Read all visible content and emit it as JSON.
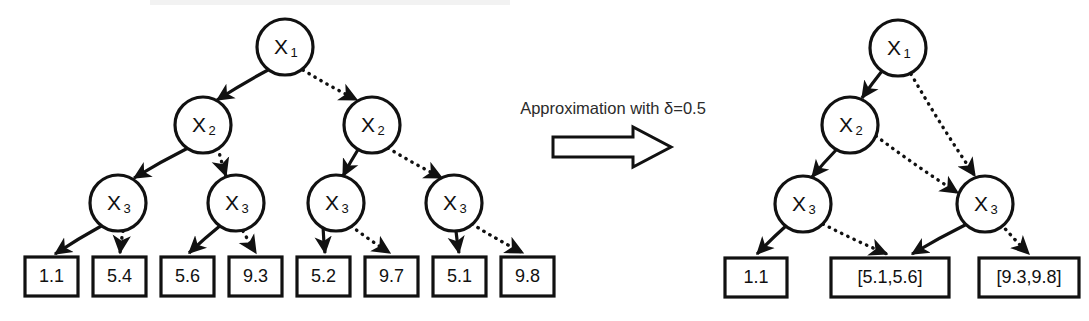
{
  "figure": {
    "background_color": "#ffffff",
    "stroke_color": "#111111"
  },
  "caption": {
    "text": "Approximation with δ=0.5",
    "arrow_icon": "block-right-arrow-icon"
  },
  "left_tree": {
    "name": "exact-tree",
    "nodes": [
      {
        "id": "L1",
        "label": "X",
        "sub": "1",
        "cx": 285,
        "cy": 47,
        "r": 28
      },
      {
        "id": "L2a",
        "label": "X",
        "sub": "2",
        "cx": 203,
        "cy": 125,
        "r": 28
      },
      {
        "id": "L2b",
        "label": "X",
        "sub": "2",
        "cx": 372,
        "cy": 125,
        "r": 28
      },
      {
        "id": "L3a",
        "label": "X",
        "sub": "3",
        "cx": 118,
        "cy": 203,
        "r": 28
      },
      {
        "id": "L3b",
        "label": "X",
        "sub": "3",
        "cx": 236,
        "cy": 203,
        "r": 28
      },
      {
        "id": "L3c",
        "label": "X",
        "sub": "3",
        "cx": 336,
        "cy": 203,
        "r": 28
      },
      {
        "id": "L3d",
        "label": "X",
        "sub": "3",
        "cx": 454,
        "cy": 203,
        "r": 28
      }
    ],
    "leaves": [
      {
        "id": "Lv1",
        "value": "1.1",
        "x": 25,
        "y": 257,
        "w": 53,
        "h": 39
      },
      {
        "id": "Lv2",
        "value": "5.4",
        "x": 93,
        "y": 257,
        "w": 53,
        "h": 39
      },
      {
        "id": "Lv3",
        "value": "5.6",
        "x": 161,
        "y": 257,
        "w": 53,
        "h": 39
      },
      {
        "id": "Lv4",
        "value": "9.3",
        "x": 229,
        "y": 257,
        "w": 53,
        "h": 39
      },
      {
        "id": "Lv5",
        "value": "5.2",
        "x": 297,
        "y": 257,
        "w": 53,
        "h": 39
      },
      {
        "id": "Lv6",
        "value": "9.7",
        "x": 365,
        "y": 257,
        "w": 53,
        "h": 39
      },
      {
        "id": "Lv7",
        "value": "5.1",
        "x": 433,
        "y": 257,
        "w": 53,
        "h": 39
      },
      {
        "id": "Lv8",
        "value": "9.8",
        "x": 501,
        "y": 257,
        "w": 53,
        "h": 39
      }
    ],
    "edges": [
      {
        "from": "L1",
        "to": "L2a",
        "style": "solid",
        "x1": 268,
        "y1": 70,
        "x2": 217,
        "y2": 100
      },
      {
        "from": "L1",
        "to": "L2b",
        "style": "dotted",
        "x1": 303,
        "y1": 70,
        "x2": 357,
        "y2": 100
      },
      {
        "from": "L2a",
        "to": "L3a",
        "style": "solid",
        "x1": 188,
        "y1": 148,
        "x2": 134,
        "y2": 178
      },
      {
        "from": "L2a",
        "to": "L3b",
        "style": "dotted",
        "x1": 218,
        "y1": 148,
        "x2": 226,
        "y2": 176
      },
      {
        "from": "L2b",
        "to": "L3c",
        "style": "solid",
        "x1": 359,
        "y1": 148,
        "x2": 343,
        "y2": 176
      },
      {
        "from": "L2b",
        "to": "L3d",
        "style": "dotted",
        "x1": 388,
        "y1": 148,
        "x2": 442,
        "y2": 178
      },
      {
        "from": "L3a",
        "to": "Lv1",
        "style": "solid",
        "x1": 103,
        "y1": 225,
        "x2": 55,
        "y2": 254
      },
      {
        "from": "L3a",
        "to": "Lv2",
        "style": "dotted",
        "x1": 123,
        "y1": 231,
        "x2": 120,
        "y2": 253
      },
      {
        "from": "L3b",
        "to": "Lv3",
        "style": "solid",
        "x1": 221,
        "y1": 225,
        "x2": 189,
        "y2": 253
      },
      {
        "from": "L3b",
        "to": "Lv4",
        "style": "dotted",
        "x1": 243,
        "y1": 231,
        "x2": 256,
        "y2": 253
      },
      {
        "from": "L3c",
        "to": "Lv5",
        "style": "solid",
        "x1": 323,
        "y1": 226,
        "x2": 325,
        "y2": 253
      },
      {
        "from": "L3c",
        "to": "Lv6",
        "style": "dotted",
        "x1": 351,
        "y1": 226,
        "x2": 390,
        "y2": 253
      },
      {
        "from": "L3d",
        "to": "Lv7",
        "style": "solid",
        "x1": 456,
        "y1": 231,
        "x2": 459,
        "y2": 253
      },
      {
        "from": "L3d",
        "to": "Lv8",
        "style": "dotted",
        "x1": 472,
        "y1": 224,
        "x2": 523,
        "y2": 253
      }
    ]
  },
  "right_tree": {
    "name": "approximated-tree",
    "nodes": [
      {
        "id": "R1",
        "label": "X",
        "sub": "1",
        "cx": 898,
        "cy": 48,
        "r": 28
      },
      {
        "id": "R2",
        "label": "X",
        "sub": "2",
        "cx": 850,
        "cy": 125,
        "r": 28
      },
      {
        "id": "R3a",
        "label": "X",
        "sub": "3",
        "cx": 803,
        "cy": 204,
        "r": 28
      },
      {
        "id": "R3b",
        "label": "X",
        "sub": "3",
        "cx": 985,
        "cy": 204,
        "r": 28
      }
    ],
    "leaves": [
      {
        "id": "Rv1",
        "value": "1.1",
        "x": 725,
        "y": 258,
        "w": 62,
        "h": 39
      },
      {
        "id": "Rv2",
        "value": "[5.1,5.6]",
        "x": 831,
        "y": 258,
        "w": 118,
        "h": 39
      },
      {
        "id": "Rv3",
        "value": "[9.3,9.8]",
        "x": 979,
        "y": 258,
        "w": 100,
        "h": 39
      }
    ],
    "edges": [
      {
        "from": "R1",
        "to": "R2",
        "style": "solid",
        "x1": 882,
        "y1": 71,
        "x2": 862,
        "y2": 98
      },
      {
        "from": "R1",
        "to": "R3b",
        "style": "dotted",
        "x1": 911,
        "y1": 74,
        "x2": 975,
        "y2": 176
      },
      {
        "from": "R2",
        "to": "R3a",
        "style": "solid",
        "x1": 837,
        "y1": 149,
        "x2": 812,
        "y2": 177
      },
      {
        "from": "R2",
        "to": "R3b",
        "style": "dotted",
        "x1": 876,
        "y1": 136,
        "x2": 958,
        "y2": 193
      },
      {
        "from": "R3a",
        "to": "Rv1",
        "style": "solid",
        "x1": 787,
        "y1": 225,
        "x2": 757,
        "y2": 254
      },
      {
        "from": "R3a",
        "to": "Rv2",
        "style": "dotted",
        "x1": 823,
        "y1": 224,
        "x2": 887,
        "y2": 254
      },
      {
        "from": "R3b",
        "to": "Rv2",
        "style": "solid",
        "x1": 967,
        "y1": 224,
        "x2": 912,
        "y2": 254
      },
      {
        "from": "R3b",
        "to": "Rv3",
        "style": "dotted",
        "x1": 1001,
        "y1": 224,
        "x2": 1029,
        "y2": 254
      }
    ]
  }
}
